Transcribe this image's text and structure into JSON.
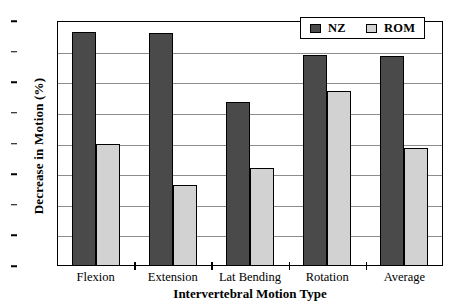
{
  "chart_data": {
    "type": "bar",
    "title": "",
    "xlabel": "Intervertebral Motion Type",
    "ylabel": "Decrease in Motion (%)",
    "categories": [
      "Flexion",
      "Extension",
      "Lat Bending",
      "Rotation",
      "Average"
    ],
    "series": [
      {
        "name": "NZ",
        "values": [
          76.5,
          76.0,
          53.5,
          69.0,
          68.5
        ]
      },
      {
        "name": "ROM",
        "values": [
          40.0,
          26.5,
          32.0,
          57.0,
          38.5
        ]
      }
    ],
    "ylim": [
      0,
      80
    ],
    "yticks": [
      0,
      10,
      20,
      30,
      40,
      50,
      60,
      70,
      80
    ],
    "ytick_labels": [
      "0",
      "10",
      "20",
      "30",
      "40",
      "50",
      "60",
      "70",
      "80"
    ],
    "grid": true,
    "legend_position": "top-right",
    "colors": {
      "nz": "#4a4a4a",
      "rom": "#d2d2d2",
      "axis": "#000000",
      "gridline": "#8c8c8c",
      "background": "#ffffff"
    }
  },
  "legend": {
    "items": [
      {
        "label": "NZ",
        "swatch": "dark-gray-square"
      },
      {
        "label": "ROM",
        "swatch": "light-gray-square"
      }
    ]
  }
}
